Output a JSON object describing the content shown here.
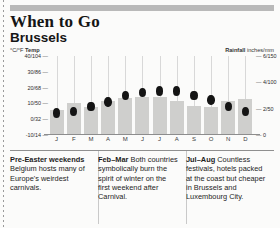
{
  "header": {
    "title": "When to Go",
    "subtitle": "Brussels"
  },
  "axis_captions": {
    "left_unit": "°C/°F",
    "left_label": "Temp",
    "right_label": "Rainfall",
    "right_unit": "inches/mm"
  },
  "notes": [
    {
      "lead": "Pre-Easter weekends",
      "text": " Belgium hosts many of Europe's weirdest carnivals."
    },
    {
      "lead": "Feb–Mar",
      "text": " Both countries symbolically burn the spirit of winter on the first weekend after Carnival."
    },
    {
      "lead": "Jul–Aug",
      "text": " Countless festivals, hotels packed at the coast but cheaper in Brussels and Luxembourg City."
    }
  ],
  "chart_data": {
    "type": "bar",
    "title": "Brussels",
    "xlabel": "",
    "ylabel": "Temp °C/°F",
    "categories": [
      "J",
      "F",
      "M",
      "A",
      "M",
      "J",
      "J",
      "A",
      "S",
      "O",
      "N",
      "D"
    ],
    "grid": true,
    "legend": "none",
    "temp_axis": {
      "label": "°C/°F Temp",
      "ticks": [
        "40/104",
        "30/86",
        "20/68",
        "10/50",
        "0/32",
        "-10/14"
      ],
      "values_c": [
        40,
        30,
        20,
        10,
        0,
        -10
      ],
      "ylim": [
        -10,
        40
      ]
    },
    "rain_axis": {
      "label": "Rainfall inches/mm",
      "ticks": [
        "6/150",
        "4/100",
        "2/50",
        "0"
      ],
      "values_in": [
        6,
        4,
        2,
        0
      ],
      "ylim": [
        0,
        6
      ]
    },
    "series": [
      {
        "name": "Rainfall",
        "unit": "inches",
        "type": "bar",
        "values": [
          1.9,
          2.4,
          2.1,
          2.6,
          2.8,
          2.9,
          2.9,
          2.6,
          2.2,
          2.1,
          2.6,
          2.7
        ]
      },
      {
        "name": "Temperature",
        "unit": "°C",
        "type": "marker",
        "values": [
          4,
          5,
          8,
          11,
          15,
          17,
          18,
          18,
          15,
          12,
          8,
          5
        ]
      }
    ]
  }
}
